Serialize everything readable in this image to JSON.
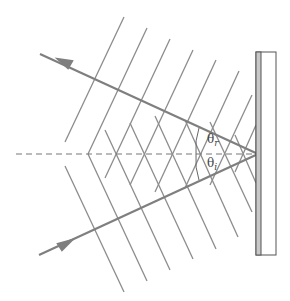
{
  "diagram": {
    "labels": {
      "theta_r": {
        "symbol": "θ",
        "sub": "r"
      },
      "theta_i": {
        "symbol": "θ",
        "sub": "i"
      }
    },
    "colors": {
      "line": "#8a8a8a",
      "ray": "#7f7f7f",
      "mirror_fill": "#c8c8c8",
      "mirror_stroke": "#555555"
    },
    "elements": [
      "incident ray",
      "reflected ray",
      "normal (dashed)",
      "incident wavefronts",
      "reflected wavefronts",
      "mirror"
    ]
  }
}
